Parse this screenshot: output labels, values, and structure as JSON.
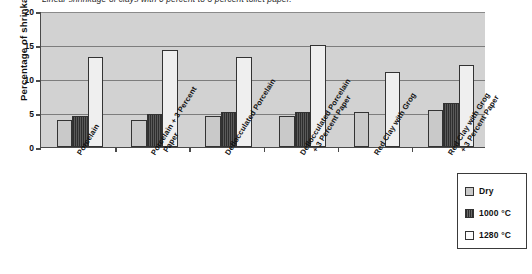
{
  "chart_data": {
    "type": "bar",
    "title": "Linear shrinkage of clays with 0 percent to 3 percent toilet paper.",
    "xlabel": "",
    "ylabel": "Percentage of shrinkage",
    "ylim": [
      0,
      20
    ],
    "yticks": [
      "0",
      "5",
      "10",
      "15",
      "20"
    ],
    "grid": true,
    "legend_position": "bottom-right",
    "categories": [
      "Porcelain",
      "Porcelain + 3 Percent Paper",
      "Deflocculated Porcelain",
      "Deflocculated Porcelain + 3 Percent Paper",
      "Red Clay with Grog",
      "Red Clay with Grog + 3 Percent Paper"
    ],
    "category_lines": [
      [
        "Porcelain",
        ""
      ],
      [
        "Porcelain + 3 Percent",
        "Paper"
      ],
      [
        "Deflocculated Porcelain",
        ""
      ],
      [
        "Deflocculated Porcelain",
        "+ 3 Percent Paper"
      ],
      [
        "Red Clay with Grog",
        ""
      ],
      [
        "Red Clay with Grog",
        "+ 3 Percent Paper"
      ]
    ],
    "series": [
      {
        "name": "Dry",
        "color": "#c9c9c9",
        "values": [
          4.0,
          3.9,
          4.5,
          4.5,
          5.2,
          5.4
        ]
      },
      {
        "name": "1000 °C",
        "color": "#3b3b3b",
        "values": [
          4.6,
          4.9,
          5.1,
          5.2,
          0.0,
          6.4
        ]
      },
      {
        "name": "1280 °C",
        "color": "#efefef",
        "values": [
          13.3,
          14.3,
          13.3,
          15.0,
          11.0,
          12.1
        ]
      }
    ]
  },
  "legend": {
    "items": [
      {
        "label": "Dry"
      },
      {
        "label": "1000 °C"
      },
      {
        "label": "1280 °C"
      }
    ]
  }
}
